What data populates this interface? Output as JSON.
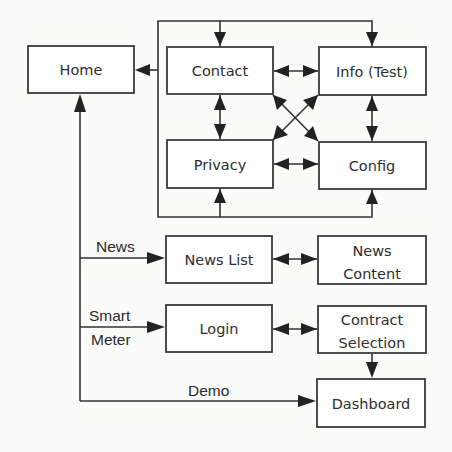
{
  "diagram": {
    "nodes": [
      {
        "id": "home",
        "label": "Home"
      },
      {
        "id": "contact",
        "label": "Contact"
      },
      {
        "id": "info",
        "label": "Info (Test)"
      },
      {
        "id": "privacy",
        "label": "Privacy"
      },
      {
        "id": "config",
        "label": "Config"
      },
      {
        "id": "news_list",
        "label": "News List"
      },
      {
        "id": "news_content",
        "label_line1": "News",
        "label_line2": "Content"
      },
      {
        "id": "login",
        "label": "Login"
      },
      {
        "id": "contract_selection",
        "label_line1": "Contract",
        "label_line2": "Selection"
      },
      {
        "id": "dashboard",
        "label": "Dashboard"
      }
    ],
    "edge_labels": {
      "news": "News",
      "smart_meter_line1": "Smart",
      "smart_meter_line2": "Meter",
      "demo": "Demo"
    },
    "edges": [
      {
        "from": "settings_group",
        "to": "home",
        "type": "directed"
      },
      {
        "from": "contact",
        "to": "info",
        "type": "bidirectional"
      },
      {
        "from": "contact",
        "to": "privacy",
        "type": "bidirectional"
      },
      {
        "from": "contact",
        "to": "config",
        "type": "bidirectional"
      },
      {
        "from": "privacy",
        "to": "info",
        "type": "bidirectional"
      },
      {
        "from": "info",
        "to": "config",
        "type": "bidirectional"
      },
      {
        "from": "privacy",
        "to": "config",
        "type": "bidirectional"
      },
      {
        "from": "home",
        "to": "news_list",
        "label": "News",
        "type": "directed"
      },
      {
        "from": "home",
        "to": "login",
        "label": "Smart Meter",
        "type": "directed"
      },
      {
        "from": "home",
        "to": "dashboard",
        "label": "Demo",
        "type": "directed"
      },
      {
        "from": "news_list",
        "to": "news_content",
        "type": "bidirectional"
      },
      {
        "from": "login",
        "to": "contract_selection",
        "type": "bidirectional"
      },
      {
        "from": "contract_selection",
        "to": "dashboard",
        "type": "directed"
      }
    ]
  }
}
